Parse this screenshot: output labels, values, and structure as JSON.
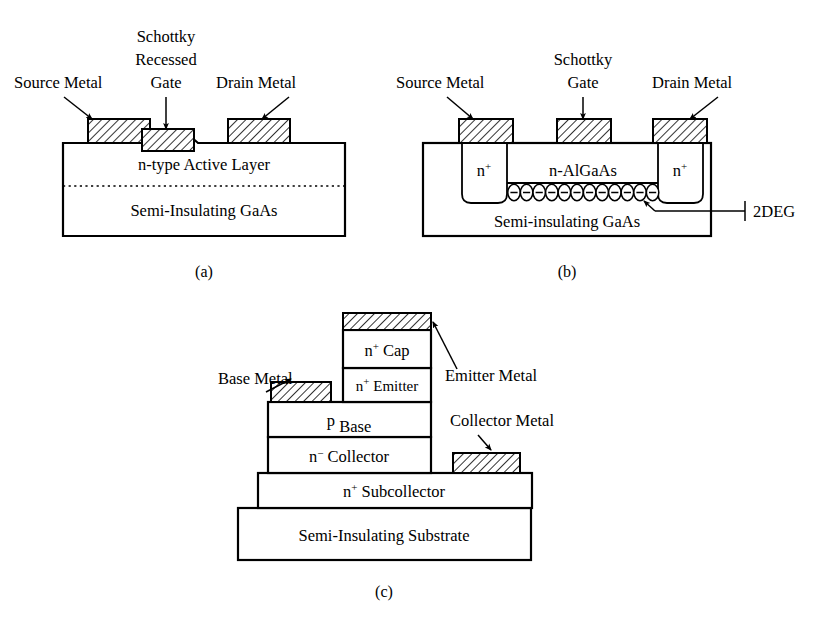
{
  "figure": {
    "background_color": "#ffffff",
    "line_color": "#000000",
    "hatch_color": "#000000",
    "hatch_fill": "#ffffff"
  },
  "panel_a": {
    "caption": "(a)",
    "device": "MESFET with recessed Schottky gate",
    "callouts": {
      "source": "Source Metal",
      "gate_line1": "Schottky",
      "gate_line2": "Recessed",
      "gate_line3": "Gate",
      "drain": "Drain Metal"
    },
    "layers": [
      {
        "label": "n-type Active Layer"
      },
      {
        "label": "Semi-Insulating GaAs"
      }
    ]
  },
  "panel_b": {
    "caption": "(b)",
    "device": "HEMT with two-dimensional electron gas",
    "callouts": {
      "source": "Source Metal",
      "gate_line1": "Schottky",
      "gate_line2": "Gate",
      "drain": "Drain Metal",
      "twodeg": "2DEG"
    },
    "regions": {
      "ohmic_left": "n+",
      "ohmic_left_base": "n",
      "ohmic_left_sup": "+",
      "ohmic_right": "n+",
      "ohmic_right_base": "n",
      "ohmic_right_sup": "+",
      "barrier": "n-AlGaAs",
      "substrate": "Semi-insulating GaAs"
    },
    "twodeg_electron_count": 12,
    "electron_glyph": "−"
  },
  "panel_c": {
    "caption": "(c)",
    "device": "Heterojunction bipolar transistor (HBT)",
    "callouts": {
      "base_metal": "Base Metal",
      "emitter_metal": "Emitter Metal",
      "collector_metal": "Collector Metal"
    },
    "layers": [
      {
        "base": "n",
        "sup": "+",
        "rest": " Cap",
        "label": "n+ Cap"
      },
      {
        "base": "n",
        "sup": "+",
        "rest": " Emitter",
        "label": "n+ Emitter"
      },
      {
        "base": "p",
        "sup": "",
        "rest": " Base",
        "label": "p Base"
      },
      {
        "base": "n",
        "sup": "−",
        "rest": " Collector",
        "label": "n- Collector"
      },
      {
        "base": "n",
        "sup": "+",
        "rest": " Subcollector",
        "label": "n+ Subcollector"
      },
      {
        "base": "",
        "sup": "",
        "rest": "Semi-Insulating Substrate",
        "label": "Semi-Insulating Substrate"
      }
    ]
  }
}
